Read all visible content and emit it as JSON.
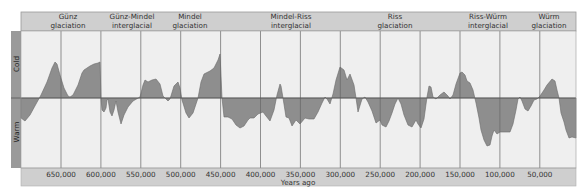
{
  "chart_data": {
    "type": "area",
    "title": "",
    "xlabel": "Years ago",
    "ylabel_top": "Cold",
    "ylabel_bottom": "Warm",
    "x_ticks": [
      "650,000",
      "600,000",
      "550,000",
      "500,000",
      "450,000",
      "400,000",
      "350,000",
      "300,000",
      "250,000",
      "200,000",
      "150,000",
      "100,000",
      "50,000"
    ],
    "x_tick_values": [
      650000,
      600000,
      550000,
      500000,
      450000,
      400000,
      350000,
      300000,
      250000,
      200000,
      150000,
      100000,
      50000
    ],
    "xlim": [
      700000,
      0
    ],
    "grid": true,
    "periods": [
      {
        "line1": "Günz",
        "line2": "glaciation",
        "center_x": 68
      },
      {
        "line1": "Günz-Mindel",
        "line2": "interglacial",
        "center_x": 132
      },
      {
        "line1": "Mindel",
        "line2": "glaciation",
        "center_x": 190
      },
      {
        "line1": "Mindel-Riss",
        "line2": "interglacial",
        "center_x": 291
      },
      {
        "line1": "Riss",
        "line2": "glaciation",
        "center_x": 395
      },
      {
        "line1": "Riss-Würm",
        "line2": "interglacial",
        "center_x": 488
      },
      {
        "line1": "Würm",
        "line2": "glaciation",
        "center_x": 549
      }
    ],
    "series": [
      {
        "name": "Relative temperature (cold up, warm down)",
        "note": "Values are relative deviations; positive = colder, negative = warmer, range approx -1..1",
        "points_px": [
          [
            21,
            118
          ],
          [
            25,
            121
          ],
          [
            30,
            115
          ],
          [
            36,
            104
          ],
          [
            41,
            95
          ],
          [
            47,
            82
          ],
          [
            52,
            68
          ],
          [
            55,
            62
          ],
          [
            57,
            64
          ],
          [
            60,
            75
          ],
          [
            64,
            88
          ],
          [
            68,
            96
          ],
          [
            70,
            97
          ],
          [
            73,
            95
          ],
          [
            78,
            85
          ],
          [
            82,
            73
          ],
          [
            84,
            70
          ],
          [
            87,
            68
          ],
          [
            90,
            66
          ],
          [
            94,
            64
          ],
          [
            98,
            63
          ],
          [
            100,
            62
          ],
          [
            101,
            98
          ],
          [
            102,
            110
          ],
          [
            104,
            112
          ],
          [
            106,
            108
          ],
          [
            107,
            100
          ],
          [
            108,
            99
          ],
          [
            110,
            112
          ],
          [
            112,
            116
          ],
          [
            114,
            110
          ],
          [
            116,
            101
          ],
          [
            118,
            112
          ],
          [
            121,
            124
          ],
          [
            124,
            115
          ],
          [
            128,
            107
          ],
          [
            133,
            101
          ],
          [
            140,
            97
          ],
          [
            143,
            85
          ],
          [
            145,
            80
          ],
          [
            148,
            82
          ],
          [
            152,
            80
          ],
          [
            156,
            79
          ],
          [
            160,
            84
          ],
          [
            163,
            96
          ],
          [
            168,
            101
          ],
          [
            170,
            99
          ],
          [
            174,
            86
          ],
          [
            178,
            82
          ],
          [
            180,
            88
          ],
          [
            182,
            100
          ],
          [
            186,
            113
          ],
          [
            189,
            118
          ],
          [
            193,
            113
          ],
          [
            198,
            98
          ],
          [
            201,
            82
          ],
          [
            204,
            74
          ],
          [
            210,
            71
          ],
          [
            214,
            68
          ],
          [
            218,
            60
          ],
          [
            220,
            54
          ],
          [
            222,
            98
          ],
          [
            224,
            117
          ],
          [
            228,
            117
          ],
          [
            232,
            119
          ],
          [
            236,
            125
          ],
          [
            240,
            128
          ],
          [
            244,
            126
          ],
          [
            248,
            120
          ],
          [
            250,
            118
          ],
          [
            254,
            118
          ],
          [
            258,
            114
          ],
          [
            263,
            112
          ],
          [
            266,
            116
          ],
          [
            270,
            121
          ],
          [
            274,
            110
          ],
          [
            277,
            95
          ],
          [
            280,
            84
          ],
          [
            281,
            86
          ],
          [
            283,
            98
          ],
          [
            286,
            117
          ],
          [
            289,
            118
          ],
          [
            292,
            126
          ],
          [
            296,
            120
          ],
          [
            300,
            124
          ],
          [
            305,
            118
          ],
          [
            309,
            119
          ],
          [
            314,
            119
          ],
          [
            318,
            112
          ],
          [
            322,
            103
          ],
          [
            325,
            97
          ],
          [
            327,
            99
          ],
          [
            330,
            104
          ],
          [
            333,
            94
          ],
          [
            336,
            80
          ],
          [
            340,
            67
          ],
          [
            344,
            70
          ],
          [
            347,
            80
          ],
          [
            350,
            74
          ],
          [
            354,
            85
          ],
          [
            356,
            98
          ],
          [
            358,
            112
          ],
          [
            362,
            99
          ],
          [
            365,
            97
          ],
          [
            368,
            102
          ],
          [
            372,
            111
          ],
          [
            376,
            123
          ],
          [
            380,
            120
          ],
          [
            382,
            125
          ],
          [
            386,
            127
          ],
          [
            389,
            121
          ],
          [
            392,
            113
          ],
          [
            395,
            104
          ],
          [
            398,
            98
          ],
          [
            401,
            104
          ],
          [
            404,
            115
          ],
          [
            408,
            125
          ],
          [
            412,
            127
          ],
          [
            416,
            120
          ],
          [
            418,
            124
          ],
          [
            421,
            128
          ],
          [
            424,
            119
          ],
          [
            427,
            97
          ],
          [
            429,
            86
          ],
          [
            431,
            87
          ],
          [
            433,
            97
          ],
          [
            436,
            99
          ],
          [
            440,
            95
          ],
          [
            444,
            92
          ],
          [
            448,
            96
          ],
          [
            450,
            99
          ],
          [
            453,
            95
          ],
          [
            456,
            84
          ],
          [
            460,
            73
          ],
          [
            462,
            72
          ],
          [
            465,
            75
          ],
          [
            467,
            81
          ],
          [
            470,
            83
          ],
          [
            473,
            90
          ],
          [
            476,
            103
          ],
          [
            479,
            118
          ],
          [
            481,
            130
          ],
          [
            484,
            140
          ],
          [
            487,
            146
          ],
          [
            490,
            145
          ],
          [
            492,
            136
          ],
          [
            494,
            130
          ],
          [
            497,
            134
          ],
          [
            500,
            132
          ],
          [
            503,
            132
          ],
          [
            507,
            132
          ],
          [
            510,
            132
          ],
          [
            513,
            124
          ],
          [
            516,
            110
          ],
          [
            518,
            99
          ],
          [
            520,
            97
          ],
          [
            522,
            101
          ],
          [
            525,
            109
          ],
          [
            528,
            111
          ],
          [
            531,
            106
          ],
          [
            534,
            100
          ],
          [
            537,
            99
          ],
          [
            540,
            96
          ],
          [
            544,
            90
          ],
          [
            547,
            85
          ],
          [
            552,
            79
          ],
          [
            555,
            81
          ],
          [
            557,
            90
          ],
          [
            559,
            98
          ],
          [
            561,
            113
          ],
          [
            564,
            122
          ],
          [
            566,
            130
          ],
          [
            569,
            138
          ],
          [
            572,
            137
          ],
          [
            576,
            138
          ]
        ]
      }
    ],
    "colors": {
      "fill": "#8e8e8e",
      "line": "#6a6a6a",
      "plot_bg": "#efefef",
      "band_bg": "#cfcfcf",
      "side_band": "#9a9a9a",
      "grid": "#666666"
    }
  }
}
